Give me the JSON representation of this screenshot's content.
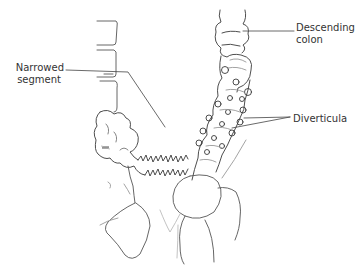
{
  "diagram": {
    "labels": {
      "narrowed_line1": "Narrowed",
      "narrowed_line2": "segment",
      "descending_line1": "Descending",
      "descending_line2": "colon",
      "diverticula": "Diverticula"
    },
    "colors": {
      "line": "#3a3a3a",
      "light_line": "#9a9a9a",
      "text": "#333333",
      "background": "#ffffff"
    }
  }
}
